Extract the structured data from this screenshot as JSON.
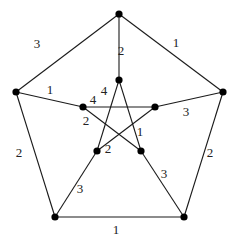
{
  "graph": {
    "name": "Petersen graph",
    "nodes": [
      {
        "id": "outer_top",
        "x": 119,
        "y": 14
      },
      {
        "id": "outer_left",
        "x": 16,
        "y": 92
      },
      {
        "id": "outer_right",
        "x": 223,
        "y": 92
      },
      {
        "id": "outer_bottom_left",
        "x": 55,
        "y": 217
      },
      {
        "id": "outer_bottom_right",
        "x": 184,
        "y": 217
      },
      {
        "id": "inner_top",
        "x": 119,
        "y": 80
      },
      {
        "id": "inner_left",
        "x": 83,
        "y": 107
      },
      {
        "id": "inner_right",
        "x": 155,
        "y": 107
      },
      {
        "id": "inner_bottom_left",
        "x": 97,
        "y": 151
      },
      {
        "id": "inner_bottom_right",
        "x": 141,
        "y": 151
      }
    ],
    "edges": [
      {
        "from": "outer_top",
        "to": "outer_left",
        "label": "3",
        "lx": 37,
        "ly": 48
      },
      {
        "from": "outer_top",
        "to": "outer_right",
        "label": "1",
        "lx": 176,
        "ly": 47
      },
      {
        "from": "outer_left",
        "to": "outer_bottom_left",
        "label": "2",
        "lx": 19,
        "ly": 157
      },
      {
        "from": "outer_right",
        "to": "outer_bottom_right",
        "label": "2",
        "lx": 210,
        "ly": 157
      },
      {
        "from": "outer_bottom_left",
        "to": "outer_bottom_right",
        "label": "1",
        "lx": 116,
        "ly": 234
      },
      {
        "from": "outer_top",
        "to": "inner_top",
        "label": "2",
        "lx": 121,
        "ly": 55
      },
      {
        "from": "outer_left",
        "to": "inner_left",
        "label": "1",
        "lx": 50,
        "ly": 94
      },
      {
        "from": "outer_right",
        "to": "inner_right",
        "label": "3",
        "lx": 186,
        "ly": 116
      },
      {
        "from": "outer_bottom_left",
        "to": "inner_bottom_left",
        "label": "3",
        "lx": 80,
        "ly": 193
      },
      {
        "from": "outer_bottom_right",
        "to": "inner_bottom_right",
        "label": "3",
        "lx": 164,
        "ly": 178
      },
      {
        "from": "inner_left",
        "to": "inner_right",
        "label": "4",
        "lx": 93,
        "ly": 104
      },
      {
        "from": "inner_top",
        "to": "inner_bottom_left",
        "label": "4",
        "lx": 104,
        "ly": 95
      },
      {
        "from": "inner_left",
        "to": "inner_bottom_right",
        "label": "2",
        "lx": 86,
        "ly": 125
      },
      {
        "from": "inner_right",
        "to": "inner_bottom_left",
        "label": "2",
        "lx": 108,
        "ly": 153
      },
      {
        "from": "inner_top",
        "to": "inner_bottom_right",
        "label": "1",
        "lx": 140,
        "ly": 136
      }
    ]
  }
}
